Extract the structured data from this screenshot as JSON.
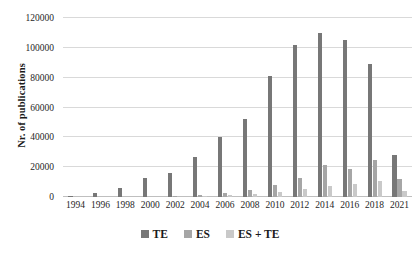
{
  "chart_data": {
    "type": "bar",
    "title": "",
    "subtitle": "",
    "xlabel": "",
    "ylabel": "Nr. of publications",
    "ylim": [
      0,
      120000
    ],
    "ytick_values": [
      0,
      20000,
      40000,
      60000,
      80000,
      100000,
      120000
    ],
    "ytick_labels": [
      "0",
      "20000",
      "40000",
      "60000",
      "80000",
      "100000",
      "120000"
    ],
    "grid": true,
    "legend_position": "bottom",
    "categories": [
      "1994",
      "1996",
      "1998",
      "2000",
      "2002",
      "2004",
      "2006",
      "2008",
      "2010",
      "2012",
      "2014",
      "2016",
      "2018",
      "2021"
    ],
    "series": [
      {
        "name": "TE",
        "color": "#777777",
        "values": [
          900,
          2400,
          6200,
          12500,
          16000,
          26500,
          40000,
          52500,
          81000,
          102000,
          110000,
          105500,
          89000,
          28500
        ]
      },
      {
        "name": "ES",
        "color": "#a6a6a6",
        "values": [
          0,
          0,
          0,
          0,
          700,
          1600,
          3000,
          4800,
          8000,
          13000,
          21500,
          18500,
          24500,
          12000
        ]
      },
      {
        "name": "ES + TE",
        "color": "#c9c9c9",
        "values": [
          0,
          0,
          0,
          0,
          0,
          600,
          1200,
          1700,
          3200,
          5500,
          7500,
          9000,
          10500,
          4000
        ]
      }
    ]
  },
  "legend": {
    "items": [
      {
        "label": "TE",
        "color": "#777777"
      },
      {
        "label": "ES",
        "color": "#a6a6a6"
      },
      {
        "label": "ES + TE",
        "color": "#c9c9c9"
      }
    ]
  }
}
